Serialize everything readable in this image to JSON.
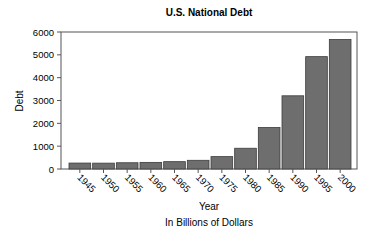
{
  "chart_data": {
    "type": "bar",
    "title": "U.S. National Debt",
    "xlabel": "Year",
    "ylabel": "Debt",
    "subtitle": "In Billions of Dollars",
    "categories": [
      "1945",
      "1950",
      "1955",
      "1960",
      "1965",
      "1970",
      "1975",
      "1980",
      "1985",
      "1990",
      "1995",
      "2000"
    ],
    "values": [
      260,
      257,
      274,
      290,
      322,
      381,
      542,
      909,
      1817,
      3206,
      4921,
      5674
    ],
    "ylim": [
      0,
      6000
    ],
    "yticks": [
      0,
      1000,
      2000,
      3000,
      4000,
      5000,
      6000
    ],
    "grid": false,
    "legend": null,
    "bar_color": "#6e6e6e",
    "bar_edge_color": "#3c3c3c"
  }
}
